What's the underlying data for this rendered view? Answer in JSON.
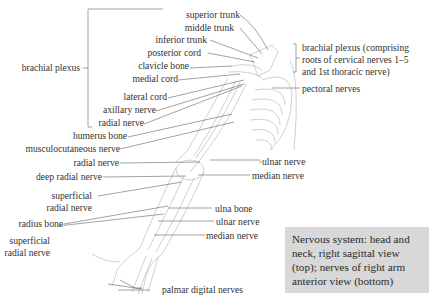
{
  "diagram": {
    "title_caption": "Nervous system: head and neck, right sagittal view (top); nerves of right arm anterior view (bottom)",
    "caption_lines": [
      "Nervous system: head and",
      "neck, right sagittal view",
      "(top); nerves of right arm",
      "anterior view (bottom)"
    ],
    "left_group_label": "brachial plexus",
    "right_group_label_lines": [
      "brachial plexus (comprising",
      "roots of cervical nerves 1–5",
      "and 1st thoracic nerve)"
    ],
    "labels_left": [
      {
        "id": "superior-trunk",
        "text": "superior trunk"
      },
      {
        "id": "middle-trunk",
        "text": "middle trunk"
      },
      {
        "id": "inferior-trunk",
        "text": "inferior trunk"
      },
      {
        "id": "posterior-cord",
        "text": "posterior cord"
      },
      {
        "id": "clavicle-bone",
        "text": "clavicle bone"
      },
      {
        "id": "medial-cord",
        "text": "medial cord"
      },
      {
        "id": "lateral-cord",
        "text": "lateral cord"
      },
      {
        "id": "axillary-nerve",
        "text": "axillary nerve"
      },
      {
        "id": "radial-nerve-upper",
        "text": "radial nerve"
      },
      {
        "id": "humerus-bone",
        "text": "humerus bone"
      },
      {
        "id": "musculocutaneous-nerve",
        "text": "musculocutaneous nerve"
      },
      {
        "id": "radial-nerve-elbow",
        "text": "radial nerve"
      },
      {
        "id": "deep-radial-nerve",
        "text": "deep radial nerve"
      },
      {
        "id": "superficial-radial-nerve-1",
        "text": "superficial radial nerve",
        "lines": [
          "superficial",
          "radial nerve"
        ]
      },
      {
        "id": "radius-bone",
        "text": "radius bone"
      },
      {
        "id": "superficial-radial-nerve-2",
        "text": "superficial radial nerve",
        "lines": [
          "superficial",
          "radial nerve"
        ]
      }
    ],
    "labels_right": [
      {
        "id": "pectoral-nerves",
        "text": "pectoral nerves"
      },
      {
        "id": "ulnar-nerve-elbow",
        "text": "ulnar nerve"
      },
      {
        "id": "median-nerve-elbow",
        "text": "median nerve"
      },
      {
        "id": "ulna-bone",
        "text": "ulna bone"
      },
      {
        "id": "ulnar-nerve-forearm",
        "text": "ulnar nerve"
      },
      {
        "id": "median-nerve-forearm",
        "text": "median nerve"
      },
      {
        "id": "palmar-digital-nerves",
        "text": "palmar digital nerves"
      }
    ],
    "colors": {
      "caption_bg": "#d8d8d8",
      "leader_line": "#555555",
      "illustration_line": "#b8b8b8",
      "text": "#333333"
    }
  }
}
